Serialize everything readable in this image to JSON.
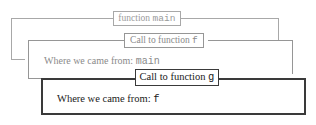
{
  "diagram": {
    "background_color": "#ffffff",
    "frames": [
      {
        "id": "frame-main",
        "depth": 0,
        "legend_prefix": "function",
        "legend_name": "main",
        "legend_text": "function main",
        "body_text": "",
        "body_prefix": "",
        "body_value": "",
        "border_color": "#a8a8a8",
        "text_color": "#9a9a9a",
        "border_width": "1px"
      },
      {
        "id": "frame-f",
        "depth": 1,
        "legend_prefix": "Call to function",
        "legend_name": "f",
        "legend_text": "Call to function f",
        "body_text": "Where we came from: main",
        "body_prefix": "Where we came from:",
        "body_value": "main",
        "border_color": "#969696",
        "text_color": "#8f8f8f",
        "border_width": "1px"
      },
      {
        "id": "frame-g",
        "depth": 2,
        "legend_prefix": "Call to function",
        "legend_name": "g",
        "legend_text": "Call to function g",
        "body_text": "Where we came from: f",
        "body_prefix": "Where we came from:",
        "body_value": "f",
        "border_color": "#3a3a3a",
        "text_color": "#1a1a1a",
        "border_width": "2px"
      }
    ]
  }
}
